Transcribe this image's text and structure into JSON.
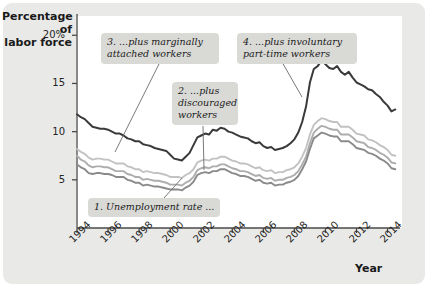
{
  "chart_data": {
    "type": "line",
    "title": "",
    "xlabel": "Year",
    "ylabel": "Percentage of labor force",
    "xlim": [
      1994,
      2014.8
    ],
    "ylim": [
      0,
      22
    ],
    "grid": false,
    "legend_position": "none (inline callouts)",
    "y_ticks": [
      {
        "value": 20,
        "label": "20%"
      },
      {
        "value": 15,
        "label": "15"
      },
      {
        "value": 10,
        "label": "10"
      },
      {
        "value": 5,
        "label": "5"
      }
    ],
    "x_ticks": [
      {
        "value": 1994,
        "label": "1994"
      },
      {
        "value": 1996,
        "label": "1996"
      },
      {
        "value": 1998,
        "label": "1998"
      },
      {
        "value": 2000,
        "label": "2000"
      },
      {
        "value": 2002,
        "label": "2002"
      },
      {
        "value": 2004,
        "label": "2004"
      },
      {
        "value": 2006,
        "label": "2006"
      },
      {
        "value": 2008,
        "label": "2008"
      },
      {
        "value": 2010,
        "label": "2010"
      },
      {
        "value": 2012,
        "label": "2012"
      },
      {
        "value": 2014,
        "label": "2014"
      }
    ],
    "x": [
      1994.0,
      1994.25,
      1994.5,
      1994.75,
      1995.0,
      1995.25,
      1995.5,
      1995.75,
      1996.0,
      1996.25,
      1996.5,
      1996.75,
      1997.0,
      1997.25,
      1997.5,
      1997.75,
      1998.0,
      1998.25,
      1998.5,
      1998.75,
      1999.0,
      1999.25,
      1999.5,
      1999.75,
      2000.0,
      2000.25,
      2000.5,
      2000.75,
      2001.0,
      2001.25,
      2001.5,
      2001.75,
      2002.0,
      2002.25,
      2002.5,
      2002.75,
      2003.0,
      2003.25,
      2003.5,
      2003.75,
      2004.0,
      2004.25,
      2004.5,
      2004.75,
      2005.0,
      2005.25,
      2005.5,
      2005.75,
      2006.0,
      2006.25,
      2006.5,
      2006.75,
      2007.0,
      2007.25,
      2007.5,
      2007.75,
      2008.0,
      2008.25,
      2008.5,
      2008.75,
      2009.0,
      2009.25,
      2009.5,
      2009.75,
      2010.0,
      2010.25,
      2010.5,
      2010.75,
      2011.0,
      2011.25,
      2011.5,
      2011.75,
      2012.0,
      2012.25,
      2012.5,
      2012.75,
      2013.0,
      2013.25,
      2013.5,
      2013.75,
      2014.0,
      2014.25,
      2014.5
    ],
    "series": [
      {
        "name": "Unemployment rate",
        "callout_ref": "1. Unemployment rate ...",
        "color": "#8a8a8a",
        "values": [
          6.6,
          6.3,
          6.1,
          5.7,
          5.6,
          5.7,
          5.7,
          5.6,
          5.6,
          5.5,
          5.3,
          5.3,
          5.3,
          5.0,
          4.9,
          4.7,
          4.7,
          4.4,
          4.5,
          4.4,
          4.3,
          4.3,
          4.2,
          4.1,
          4.0,
          4.0,
          4.0,
          3.9,
          4.2,
          4.4,
          4.8,
          5.5,
          5.7,
          5.8,
          5.7,
          5.9,
          5.9,
          6.1,
          6.1,
          5.9,
          5.7,
          5.6,
          5.4,
          5.4,
          5.3,
          5.1,
          4.9,
          5.0,
          4.7,
          4.6,
          4.7,
          4.4,
          4.5,
          4.5,
          4.7,
          4.8,
          5.0,
          5.4,
          6.1,
          6.9,
          8.2,
          9.3,
          9.6,
          9.9,
          9.8,
          9.6,
          9.5,
          9.5,
          9.0,
          9.0,
          9.0,
          8.7,
          8.3,
          8.2,
          8.1,
          7.8,
          7.7,
          7.5,
          7.2,
          7.0,
          6.7,
          6.2,
          6.1
        ]
      },
      {
        "name": "plus discouraged workers",
        "callout_ref": "2. ...plus discouraged workers",
        "color": "#adadad",
        "values": [
          7.5,
          7.1,
          6.9,
          6.5,
          6.3,
          6.4,
          6.4,
          6.3,
          6.3,
          6.1,
          5.9,
          5.9,
          5.9,
          5.6,
          5.5,
          5.3,
          5.3,
          5.0,
          5.1,
          5.0,
          4.9,
          4.9,
          4.8,
          4.7,
          4.5,
          4.5,
          4.5,
          4.4,
          4.7,
          4.9,
          5.3,
          6.0,
          6.2,
          6.3,
          6.2,
          6.4,
          6.4,
          6.6,
          6.6,
          6.4,
          6.2,
          6.1,
          5.9,
          5.9,
          5.8,
          5.6,
          5.4,
          5.5,
          5.2,
          5.1,
          5.2,
          4.9,
          5.0,
          5.0,
          5.2,
          5.3,
          5.5,
          5.9,
          6.6,
          7.4,
          8.8,
          9.9,
          10.3,
          10.6,
          10.5,
          10.3,
          10.2,
          10.2,
          9.7,
          9.7,
          9.7,
          9.4,
          9.0,
          8.9,
          8.8,
          8.4,
          8.3,
          8.1,
          7.8,
          7.6,
          7.3,
          6.8,
          6.7
        ]
      },
      {
        "name": "plus marginally attached workers",
        "callout_ref": "3. ...plus marginally attached workers",
        "color": "#c2c2c2",
        "values": [
          8.2,
          7.9,
          7.7,
          7.3,
          7.1,
          7.2,
          7.2,
          7.1,
          7.1,
          6.9,
          6.7,
          6.7,
          6.7,
          6.4,
          6.3,
          6.1,
          6.1,
          5.8,
          5.9,
          5.8,
          5.7,
          5.7,
          5.6,
          5.5,
          5.3,
          5.3,
          5.3,
          5.2,
          5.5,
          5.7,
          6.1,
          6.8,
          7.0,
          7.1,
          7.0,
          7.2,
          7.2,
          7.4,
          7.4,
          7.2,
          7.0,
          6.9,
          6.7,
          6.7,
          6.6,
          6.4,
          6.2,
          6.3,
          6.0,
          5.9,
          6.0,
          5.7,
          5.8,
          5.8,
          6.0,
          6.1,
          6.3,
          6.7,
          7.4,
          8.3,
          9.7,
          10.7,
          11.1,
          11.4,
          11.3,
          11.1,
          11.0,
          11.0,
          10.5,
          10.5,
          10.5,
          10.2,
          9.8,
          9.7,
          9.6,
          9.2,
          9.1,
          8.9,
          8.6,
          8.4,
          8.1,
          7.6,
          7.5
        ]
      },
      {
        "name": "plus involuntary part-time workers",
        "callout_ref": "4. ...plus involuntary part-time workers",
        "color": "#3a3a3a",
        "values": [
          11.8,
          11.5,
          11.3,
          10.9,
          10.5,
          10.4,
          10.3,
          10.3,
          10.2,
          10.0,
          9.8,
          9.8,
          9.6,
          9.3,
          9.2,
          9.0,
          9.0,
          8.7,
          8.6,
          8.5,
          8.3,
          8.2,
          8.1,
          8.0,
          7.6,
          7.2,
          7.1,
          7.0,
          7.4,
          7.8,
          8.6,
          9.4,
          9.6,
          9.8,
          9.7,
          10.2,
          10.1,
          10.4,
          10.3,
          10.0,
          9.9,
          9.7,
          9.5,
          9.4,
          9.3,
          9.0,
          8.8,
          8.9,
          8.5,
          8.3,
          8.4,
          8.1,
          8.2,
          8.3,
          8.5,
          8.8,
          9.2,
          9.9,
          11.0,
          12.6,
          15.1,
          16.5,
          16.8,
          17.4,
          17.0,
          16.6,
          16.5,
          16.8,
          16.2,
          15.9,
          16.2,
          15.6,
          15.1,
          14.9,
          14.7,
          14.4,
          14.3,
          13.9,
          13.6,
          13.1,
          12.7,
          12.1,
          12.3
        ]
      }
    ]
  },
  "chart": {
    "y_axis_title_line1": "Percentage of",
    "y_axis_title_line2": "labor force",
    "x_axis_title": "Year",
    "y_tick_labels": [
      "20%",
      "15",
      "10",
      "5"
    ],
    "x_tick_labels": [
      "1994",
      "1996",
      "1998",
      "2000",
      "2002",
      "2004",
      "2006",
      "2008",
      "2010",
      "2012",
      "2014"
    ],
    "callouts": [
      {
        "id": "callout-1",
        "text": "1. Unemployment rate ..."
      },
      {
        "id": "callout-2",
        "text": "2. ...plus\ndiscouraged\nworkers"
      },
      {
        "id": "callout-3",
        "text": "3. ...plus marginally\nattached workers"
      },
      {
        "id": "callout-4",
        "text": "4. ...plus involuntary\npart-time workers"
      }
    ],
    "colors": {
      "panel_background": "#e9e9e7",
      "plot_background": "#ffffff",
      "callout_background": "#d9d9d6",
      "axis": "#4a4a4a",
      "series_1_unemployment": "#8a8a8a",
      "series_2_discouraged": "#adadad",
      "series_3_marginally_attached": "#c2c2c2",
      "series_4_involuntary_parttime": "#3a3a3a"
    }
  }
}
